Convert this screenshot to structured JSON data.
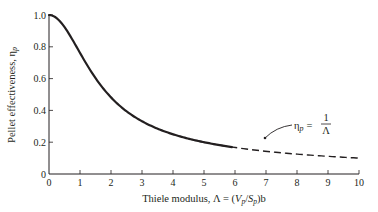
{
  "chart_data": {
    "type": "line",
    "title": "",
    "xlabel": "Thiele modulus, Λ = (V_p/S_p)b",
    "ylabel": "Pellet effectiveness, η_p",
    "xlim": [
      0,
      10
    ],
    "ylim": [
      0,
      1.0
    ],
    "grid": false,
    "x_ticks": [
      "0",
      "1",
      "2",
      "3",
      "4",
      "5",
      "6",
      "7",
      "8",
      "9",
      "10"
    ],
    "y_ticks": [
      "0",
      "0.2",
      "0.4",
      "0.6",
      "0.8",
      "1.0"
    ],
    "series": [
      {
        "name": "η_p = tanh(Λ)/Λ",
        "style": "solid",
        "x": [
          0,
          0.25,
          0.5,
          0.75,
          1.0,
          1.25,
          1.5,
          1.75,
          2.0,
          2.5,
          3.0,
          3.5,
          4.0,
          4.5,
          5.0,
          5.5,
          5.9
        ],
        "y": [
          1.0,
          0.98,
          0.92,
          0.85,
          0.76,
          0.68,
          0.6,
          0.54,
          0.48,
          0.39,
          0.33,
          0.28,
          0.25,
          0.22,
          0.2,
          0.18,
          0.17
        ]
      },
      {
        "name": "η_p = 1/Λ (asymptote)",
        "style": "dashed",
        "x": [
          4.8,
          5.5,
          6.0,
          7.0,
          8.0,
          9.0,
          10.0
        ],
        "y": [
          0.208,
          0.182,
          0.167,
          0.143,
          0.125,
          0.111,
          0.1
        ]
      }
    ],
    "annotations": [
      {
        "text_main": "η",
        "text_sub": "p",
        "text_eq": "=",
        "frac_num": "1",
        "frac_den": "Λ",
        "arrow_to": [
          6.9,
          0.143
        ]
      }
    ]
  },
  "axes": {
    "xlabel_prefix": "Thiele modulus, Λ = (",
    "xlabel_V": "V",
    "xlabel_sub1": "p",
    "xlabel_slash": "/",
    "xlabel_S": "S",
    "xlabel_sub2": "p",
    "xlabel_suffix": ")b",
    "ylabel_main": "Pellet effectiveness, η",
    "ylabel_sub": "p"
  }
}
